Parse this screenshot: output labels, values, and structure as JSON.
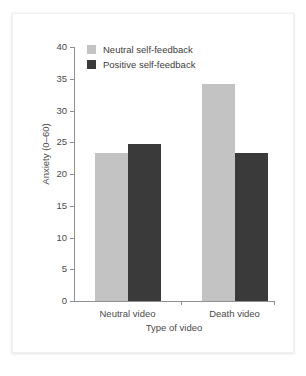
{
  "chart_data": {
    "type": "bar",
    "title": "",
    "subtitle": "",
    "xlabel": "Type of video",
    "ylabel": "Anxiety (0–60)",
    "categories": [
      "Neutral video",
      "Death video"
    ],
    "series": [
      {
        "name": "Neutral self-feedback",
        "color": "#c3c3c3",
        "values": [
          23.3,
          34.2
        ]
      },
      {
        "name": "Positive self-feedback",
        "color": "#3a3a3a",
        "values": [
          24.8,
          23.3
        ]
      }
    ],
    "ylim": [
      0,
      40
    ],
    "ytick_labels": [
      "0",
      "5",
      "10",
      "15",
      "20",
      "25",
      "30",
      "35",
      "40"
    ],
    "ytick_values": [
      0,
      5,
      10,
      15,
      20,
      25,
      30,
      35,
      40
    ],
    "grid": false,
    "legend_position": "top-left-inside"
  },
  "legend": {
    "entries": [
      {
        "label": "Neutral self-feedback",
        "swatch": "light"
      },
      {
        "label": "Positive self-feedback",
        "swatch": "dark"
      }
    ]
  },
  "colors": {
    "neutral_self_feedback": "#c3c3c3",
    "positive_self_feedback": "#3a3a3a",
    "axis": "#909090",
    "text": "#4a4a4a",
    "background": "#ffffff"
  }
}
